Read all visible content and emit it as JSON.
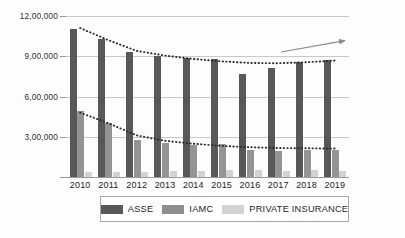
{
  "chart_data": {
    "type": "bar",
    "title": "",
    "xlabel": "",
    "ylabel": "",
    "grid": true,
    "legend_position": "bottom",
    "ylim": [
      0,
      1200000
    ],
    "yticks": [
      300000,
      600000,
      900000,
      1200000
    ],
    "ytick_labels": [
      "3,00,000",
      "6,00,000",
      "9,00,000",
      "12,00,000"
    ],
    "categories": [
      "2010",
      "2011",
      "2012",
      "2013",
      "2014",
      "2015",
      "2016",
      "2017",
      "2018",
      "2019"
    ],
    "series": [
      {
        "name": "ASSE",
        "color": "#58585a",
        "values": [
          1105000,
          1030000,
          930000,
          905000,
          885000,
          880000,
          765000,
          810000,
          860000,
          870000
        ]
      },
      {
        "name": "IAMC",
        "color": "#949396",
        "values": [
          490000,
          400000,
          275000,
          255000,
          240000,
          245000,
          205000,
          195000,
          200000,
          205000
        ]
      },
      {
        "name": "PRIVATE INSURANCE",
        "color": "#d3d3d3",
        "values": [
          35000,
          38000,
          40000,
          42000,
          48000,
          52000,
          50000,
          48000,
          50000,
          48000
        ]
      }
    ],
    "trendlines": [
      {
        "name": "ASSE trend",
        "style": "dotted",
        "color": "#2b2b2b",
        "points": [
          [
            0,
            1110000
          ],
          [
            1,
            1020000
          ],
          [
            2,
            940000
          ],
          [
            3,
            905000
          ],
          [
            4,
            880000
          ],
          [
            5,
            862000
          ],
          [
            6,
            850000
          ],
          [
            7,
            848000
          ],
          [
            8,
            855000
          ],
          [
            9,
            868000
          ]
        ]
      },
      {
        "name": "IAMC trend",
        "style": "dotted",
        "color": "#2b2b2b",
        "points": [
          [
            0,
            480000
          ],
          [
            1,
            400000
          ],
          [
            2,
            310000
          ],
          [
            3,
            270000
          ],
          [
            4,
            248000
          ],
          [
            5,
            232000
          ],
          [
            6,
            222000
          ],
          [
            7,
            216000
          ],
          [
            8,
            214000
          ],
          [
            9,
            212000
          ]
        ]
      }
    ],
    "annotations": [
      {
        "name": "upward-trend-arrow",
        "type": "arrow",
        "color": "#8a8a8a",
        "from": [
          281,
          52
        ],
        "to": [
          348,
          40
        ],
        "label": ""
      }
    ],
    "legend": [
      {
        "label": "ASSE",
        "color": "#58585a"
      },
      {
        "label": "IAMC",
        "color": "#8e8d90"
      },
      {
        "label": "PRIVATE INSURANCE",
        "color": "#d3d3d3"
      }
    ]
  }
}
